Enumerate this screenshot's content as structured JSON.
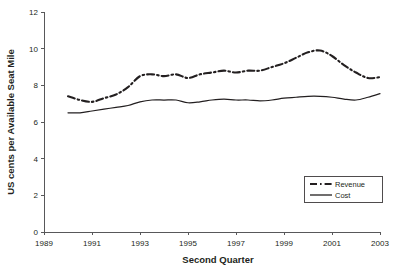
{
  "chart_data": {
    "type": "line",
    "title": "",
    "xlabel": "Second Quarter",
    "ylabel": "US cents per Available Seat Mile",
    "xlim": [
      1989,
      2003
    ],
    "ylim": [
      0,
      12
    ],
    "grid": false,
    "legend_position": "inside-lower-right",
    "xticks": [
      "1989",
      "1991",
      "1993",
      "1995",
      "1997",
      "1999",
      "2001",
      "2003"
    ],
    "xtick_values": [
      1989,
      1991,
      1993,
      1995,
      1997,
      1999,
      2001,
      2003
    ],
    "yticks": [
      "0",
      "2",
      "4",
      "6",
      "8",
      "10",
      "12"
    ],
    "ytick_values": [
      0,
      2,
      4,
      6,
      8,
      10,
      12
    ],
    "x": [
      1990,
      1990.5,
      1991,
      1991.5,
      1992,
      1992.5,
      1993,
      1993.5,
      1994,
      1994.5,
      1995,
      1995.5,
      1996,
      1996.5,
      1997,
      1997.5,
      1998,
      1998.5,
      1999,
      1999.5,
      2000,
      2000.5,
      2001,
      2001.5,
      2002,
      2002.5,
      2003
    ],
    "series": [
      {
        "name": "Revenue",
        "style": "dash-dot",
        "color": "#231f20",
        "values": [
          7.4,
          7.2,
          7.1,
          7.3,
          7.5,
          7.9,
          8.5,
          8.6,
          8.5,
          8.6,
          8.4,
          8.6,
          8.7,
          8.8,
          8.7,
          8.8,
          8.8,
          9.0,
          9.2,
          9.5,
          9.8,
          9.9,
          9.6,
          9.1,
          8.7,
          8.4,
          8.45
        ]
      },
      {
        "name": "Cost",
        "style": "solid",
        "color": "#231f20",
        "values": [
          6.5,
          6.5,
          6.6,
          6.7,
          6.8,
          6.9,
          7.1,
          7.2,
          7.2,
          7.2,
          7.05,
          7.1,
          7.2,
          7.25,
          7.2,
          7.2,
          7.15,
          7.2,
          7.3,
          7.35,
          7.4,
          7.4,
          7.35,
          7.25,
          7.2,
          7.35,
          7.55
        ]
      }
    ]
  },
  "legend": {
    "items": [
      {
        "label": "Revenue"
      },
      {
        "label": "Cost"
      }
    ]
  }
}
